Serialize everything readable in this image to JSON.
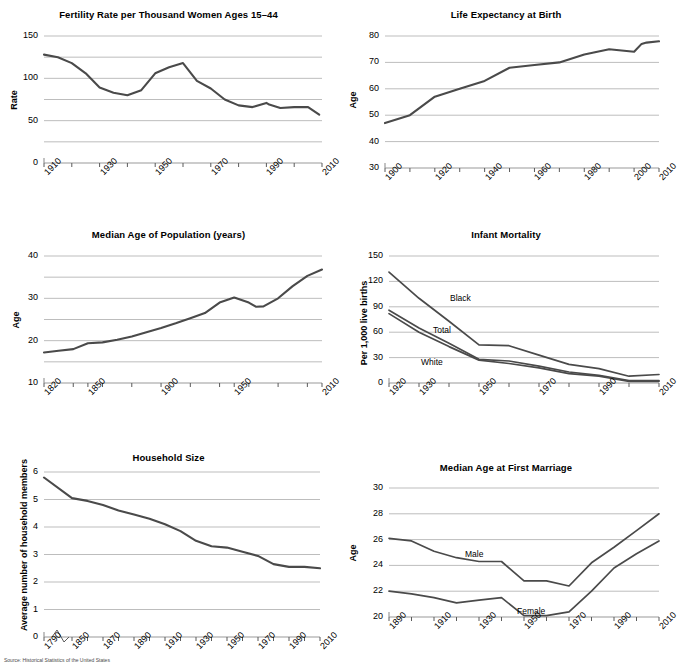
{
  "page": {
    "kind": "six-panel-figure",
    "footer_partial": "Source: Historical Statistics of the United States"
  },
  "chart_data": [
    {
      "id": "fertility",
      "type": "line",
      "title": "Fertility Rate per Thousand Women Ages 15–44",
      "xlabel": "",
      "ylabel": "Rate",
      "ylim": [
        0,
        150
      ],
      "yticks": [
        0,
        50,
        100,
        150
      ],
      "ytick_labels": [
        "0",
        "50",
        "100",
        "150"
      ],
      "gridlines": [
        25,
        50,
        75,
        100,
        125,
        150
      ],
      "xlim": [
        1910,
        2010
      ],
      "xticks": [
        1910,
        1920,
        1930,
        1940,
        1950,
        1960,
        1970,
        1980,
        1990,
        2000,
        2010
      ],
      "xtick_labels": [
        "1910",
        "",
        "1930",
        "",
        "1950",
        "",
        "1970",
        "",
        "1990",
        "",
        "2010"
      ],
      "grid": true,
      "legend": "none",
      "series": [
        {
          "name": "Fertility rate",
          "x": [
            1910,
            1915,
            1920,
            1925,
            1930,
            1935,
            1940,
            1945,
            1950,
            1955,
            1960,
            1965,
            1970,
            1975,
            1980,
            1985,
            1990,
            1991,
            1995,
            2000,
            2005,
            2009
          ],
          "values": [
            128,
            125,
            118,
            106,
            89,
            83,
            80,
            86,
            106,
            113,
            118,
            97,
            88,
            75,
            68,
            66,
            71,
            69,
            65,
            66,
            66,
            57
          ]
        }
      ]
    },
    {
      "id": "life_expectancy",
      "type": "line",
      "title": "Life Expectancy at Birth",
      "xlabel": "",
      "ylabel": "Age",
      "ylim": [
        30,
        80
      ],
      "yticks": [
        30,
        40,
        50,
        60,
        70,
        80
      ],
      "ytick_labels": [
        "30",
        "40",
        "50",
        "60",
        "70",
        "80"
      ],
      "gridlines": [
        40,
        50,
        60,
        70,
        80
      ],
      "xlim": [
        1900,
        2010
      ],
      "xticks": [
        1900,
        1910,
        1920,
        1930,
        1940,
        1950,
        1960,
        1970,
        1980,
        1990,
        2000,
        2010
      ],
      "xtick_labels": [
        "1900",
        "",
        "1920",
        "",
        "1940",
        "",
        "1960",
        "",
        "1980",
        "",
        "2000",
        "2010"
      ],
      "grid": true,
      "legend": "none",
      "series": [
        {
          "name": "Life expectancy",
          "x": [
            1900,
            1910,
            1920,
            1930,
            1940,
            1950,
            1960,
            1970,
            1980,
            1990,
            1995,
            2000,
            2003,
            2005,
            2010
          ],
          "values": [
            47,
            50,
            57,
            60,
            63,
            68,
            69,
            70,
            73,
            75,
            74.5,
            74,
            77,
            77.5,
            78
          ]
        }
      ]
    },
    {
      "id": "median_age_population",
      "type": "line",
      "title": "Median Age of Population (years)",
      "xlabel": "",
      "ylabel": "Age",
      "ylim": [
        10,
        40
      ],
      "yticks": [
        10,
        20,
        30,
        40
      ],
      "ytick_labels": [
        "10",
        "20",
        "30",
        "40"
      ],
      "gridlines": [
        15,
        20,
        25,
        30,
        35,
        40
      ],
      "xlim": [
        1820,
        2010
      ],
      "xticks": [
        1820,
        1840,
        1850,
        1860,
        1880,
        1900,
        1920,
        1940,
        1950,
        1960,
        1980,
        2000,
        2010
      ],
      "xtick_labels": [
        "1820",
        "1850",
        "1900",
        "1950",
        "2010"
      ],
      "grid": true,
      "legend": "none",
      "series": [
        {
          "name": "Median age",
          "x": [
            1820,
            1830,
            1840,
            1850,
            1860,
            1870,
            1880,
            1890,
            1900,
            1910,
            1920,
            1930,
            1940,
            1950,
            1960,
            1965,
            1970,
            1980,
            1990,
            2000,
            2010
          ],
          "values": [
            17.2,
            17.6,
            18.0,
            19.4,
            19.6,
            20.2,
            21.0,
            22.0,
            23.0,
            24.1,
            25.3,
            26.5,
            29.0,
            30.2,
            29.0,
            28.0,
            28.1,
            30.0,
            32.9,
            35.3,
            36.8
          ]
        }
      ]
    },
    {
      "id": "infant_mortality",
      "type": "line",
      "title": "Infant Mortality",
      "xlabel": "",
      "ylabel": "Per 1,000 live births",
      "ylim": [
        0,
        150
      ],
      "yticks": [
        0,
        30,
        60,
        90,
        120,
        150
      ],
      "ytick_labels": [
        "0",
        "30",
        "60",
        "90",
        "120",
        "150"
      ],
      "gridlines": [
        30,
        60,
        90,
        120,
        150
      ],
      "xlim": [
        1920,
        2010
      ],
      "xticks": [
        1920,
        1930,
        1940,
        1950,
        1960,
        1970,
        1980,
        1990,
        2000,
        2010
      ],
      "xtick_labels": [
        "1920",
        "1930",
        "",
        "1950",
        "",
        "1970",
        "",
        "1990",
        "",
        "2010"
      ],
      "grid": true,
      "legend": "inline-labels",
      "series": [
        {
          "name": "Black",
          "label": "Black",
          "x": [
            1920,
            1930,
            1940,
            1950,
            1960,
            1970,
            1980,
            1990,
            2000,
            2010
          ],
          "values": [
            131,
            100,
            73,
            45,
            44,
            33,
            22,
            17,
            8,
            10
          ]
        },
        {
          "name": "Total",
          "label": "Total",
          "x": [
            1920,
            1930,
            1940,
            1950,
            1960,
            1970,
            1980,
            1990,
            2000,
            2010
          ],
          "values": [
            86,
            65,
            47,
            28,
            26,
            20,
            13,
            9,
            3,
            3
          ]
        },
        {
          "name": "White",
          "label": "White",
          "x": [
            1920,
            1930,
            1940,
            1950,
            1960,
            1970,
            1980,
            1990,
            2000,
            2010
          ],
          "values": [
            82,
            60,
            43,
            27,
            23,
            18,
            11,
            8,
            2,
            2
          ]
        }
      ]
    },
    {
      "id": "household_size",
      "type": "line",
      "title": "Household Size",
      "xlabel": "",
      "ylabel": "Average number of household members",
      "ylim": [
        0,
        6
      ],
      "yticks": [
        0,
        1,
        2,
        3,
        4,
        5,
        6
      ],
      "ytick_labels": [
        "0",
        "1",
        "2",
        "3",
        "4",
        "5",
        "6"
      ],
      "gridlines": [
        1,
        2,
        3,
        4,
        5,
        6
      ],
      "xlim": [
        1790,
        2010
      ],
      "xticks": [
        1790,
        1850,
        1860,
        1870,
        1880,
        1890,
        1900,
        1910,
        1920,
        1930,
        1940,
        1950,
        1960,
        1970,
        1980,
        1990,
        2000,
        2010
      ],
      "xtick_labels": [
        "1790",
        "1850",
        "1870",
        "1890",
        "1910",
        "1930",
        "1950",
        "1970",
        "1990",
        "2010"
      ],
      "axis_break_after": "1790",
      "grid": true,
      "legend": "none",
      "series": [
        {
          "name": "Household size",
          "x": [
            1790,
            1850,
            1860,
            1870,
            1880,
            1890,
            1900,
            1910,
            1920,
            1930,
            1940,
            1950,
            1960,
            1970,
            1980,
            1990,
            2000,
            2010
          ],
          "values": [
            5.8,
            5.05,
            4.95,
            4.8,
            4.6,
            4.45,
            4.3,
            4.1,
            3.85,
            3.5,
            3.3,
            3.25,
            3.1,
            2.95,
            2.65,
            2.55,
            2.55,
            2.5
          ]
        }
      ]
    },
    {
      "id": "median_age_first_marriage",
      "type": "line",
      "title": "Median Age at First Marriage",
      "xlabel": "",
      "ylabel": "Age",
      "ylim": [
        20,
        30
      ],
      "yticks": [
        20,
        22,
        24,
        26,
        28,
        30
      ],
      "ytick_labels": [
        "20",
        "22",
        "24",
        "26",
        "28",
        "30"
      ],
      "gridlines": [
        22,
        24,
        26,
        28,
        30
      ],
      "xlim": [
        1890,
        2010
      ],
      "xticks": [
        1890,
        1900,
        1910,
        1920,
        1930,
        1940,
        1950,
        1960,
        1970,
        1980,
        1990,
        2000,
        2010
      ],
      "xtick_labels": [
        "1890",
        "",
        "1910",
        "",
        "1930",
        "",
        "1950",
        "",
        "1970",
        "",
        "1990",
        "",
        "2010"
      ],
      "grid": true,
      "legend": "inline-labels",
      "series": [
        {
          "name": "Male",
          "label": "Male",
          "x": [
            1890,
            1900,
            1910,
            1920,
            1930,
            1940,
            1950,
            1960,
            1970,
            1980,
            1990,
            2000,
            2010
          ],
          "values": [
            26.1,
            25.9,
            25.1,
            24.6,
            24.3,
            24.3,
            22.8,
            22.8,
            22.4,
            24.2,
            25.4,
            26.7,
            28.0
          ]
        },
        {
          "name": "Female",
          "label": "Female",
          "x": [
            1890,
            1900,
            1910,
            1920,
            1930,
            1940,
            1950,
            1960,
            1970,
            1980,
            1990,
            2000,
            2010
          ],
          "values": [
            22.0,
            21.8,
            21.5,
            21.1,
            21.3,
            21.5,
            20.1,
            20.1,
            20.4,
            22.0,
            23.8,
            24.9,
            25.9
          ]
        }
      ]
    }
  ],
  "colors": {
    "line": "#4a4a4a",
    "grid": "#bdbdbd",
    "axis": "#9a9a9a",
    "text": "#000000"
  }
}
